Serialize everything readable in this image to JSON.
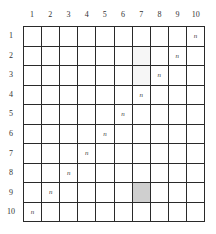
{
  "columns": [
    "1",
    "2",
    "3",
    "4",
    "5",
    "6",
    "7",
    "8",
    "9",
    "10"
  ],
  "rows": [
    "1",
    "2",
    "3",
    "4",
    "5",
    "6",
    "7",
    "8",
    "9",
    "10"
  ],
  "mark_symbol": "n",
  "cells": [
    [
      "",
      "",
      "",
      "",
      "",
      "",
      "",
      "",
      "",
      "n"
    ],
    [
      "",
      "",
      "",
      "",
      "",
      "",
      "",
      "",
      "n",
      ""
    ],
    [
      "",
      "",
      "",
      "",
      "",
      "",
      "",
      "n",
      "",
      ""
    ],
    [
      "",
      "",
      "",
      "",
      "",
      "",
      "n",
      "",
      "",
      ""
    ],
    [
      "",
      "",
      "",
      "",
      "",
      "n",
      "",
      "",
      "",
      ""
    ],
    [
      "",
      "",
      "",
      "",
      "n",
      "",
      "",
      "",
      "",
      ""
    ],
    [
      "",
      "",
      "",
      "n",
      "",
      "",
      "",
      "",
      "",
      ""
    ],
    [
      "",
      "",
      "n",
      "",
      "",
      "",
      "",
      "",
      "",
      ""
    ],
    [
      "",
      "n",
      "",
      "",
      "",
      "",
      "",
      "",
      "",
      ""
    ],
    [
      "n",
      "",
      "",
      "",
      "",
      "",
      "",
      "",
      "",
      ""
    ]
  ],
  "shaded_cells": [
    {
      "row": 9,
      "col": 7,
      "color": "#cfcfcf"
    }
  ],
  "faint_cells": [
    {
      "row": 2,
      "col": 7
    },
    {
      "row": 3,
      "col": 7
    }
  ],
  "colors": {
    "grid_line": "#2a2a2a",
    "shaded": "#cfcfcf",
    "background": "#ffffff"
  }
}
